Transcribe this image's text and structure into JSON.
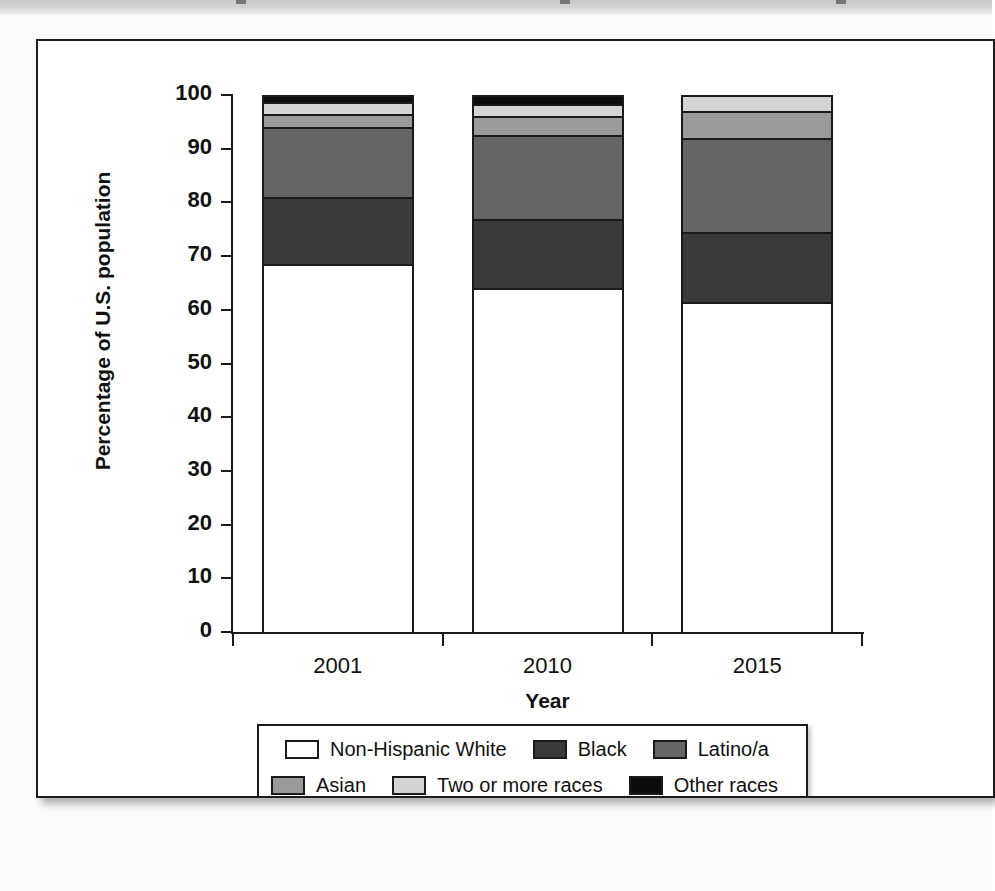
{
  "page": {
    "background_color": "#fbfbfb",
    "frame_border_color": "#1d1d1d"
  },
  "chart_data": {
    "type": "bar",
    "subtype": "stacked-bar-100-percent",
    "title": "",
    "xlabel": "Year",
    "ylabel": "Percentage of U.S. population",
    "categories": [
      "2001",
      "2010",
      "2015"
    ],
    "ylim": [
      0,
      100
    ],
    "yticks": [
      0,
      10,
      20,
      30,
      40,
      50,
      60,
      70,
      80,
      90,
      100
    ],
    "ytick_labels": [
      "0",
      "10",
      "20",
      "30",
      "40",
      "50",
      "60",
      "70",
      "80",
      "90",
      "100"
    ],
    "grid": false,
    "legend_position": "bottom",
    "stack_order_bottom_to_top": [
      "Non-Hispanic White",
      "Black",
      "Latino/a",
      "Asian",
      "Two or more races",
      "Other races"
    ],
    "series": [
      {
        "name": "Non-Hispanic White",
        "color": "#ffffff",
        "values": [
          68.5,
          64.0,
          61.5
        ]
      },
      {
        "name": "Black",
        "color": "#3a3a3a",
        "values": [
          12.5,
          13.0,
          13.0
        ]
      },
      {
        "name": "Latino/a",
        "color": "#656565",
        "values": [
          13.0,
          15.5,
          17.5
        ]
      },
      {
        "name": "Asian",
        "color": "#9a9a9a",
        "values": [
          2.5,
          3.5,
          5.0
        ]
      },
      {
        "name": "Two or more races",
        "color": "#d4d4d4",
        "values": [
          2.2,
          2.3,
          3.0
        ]
      },
      {
        "name": "Other races",
        "color": "#0d0d0d",
        "values": [
          1.3,
          1.7,
          0.0
        ]
      }
    ]
  },
  "axes": {
    "y_title": "Percentage of U.S. population",
    "x_title": "Year",
    "y_tick_labels": [
      "100",
      "90",
      "80",
      "70",
      "60",
      "50",
      "40",
      "30",
      "20",
      "10",
      "0"
    ],
    "x_tick_labels": [
      "2001",
      "2010",
      "2015"
    ]
  },
  "legend": {
    "rows": [
      [
        {
          "label": "Non-Hispanic White",
          "color": "#ffffff"
        },
        {
          "label": "Black",
          "color": "#3a3a3a"
        },
        {
          "label": "Latino/a",
          "color": "#656565"
        }
      ],
      [
        {
          "label": "Asian",
          "color": "#9a9a9a"
        },
        {
          "label": "Two or more races",
          "color": "#d4d4d4"
        },
        {
          "label": "Other races",
          "color": "#0d0d0d"
        }
      ]
    ]
  }
}
